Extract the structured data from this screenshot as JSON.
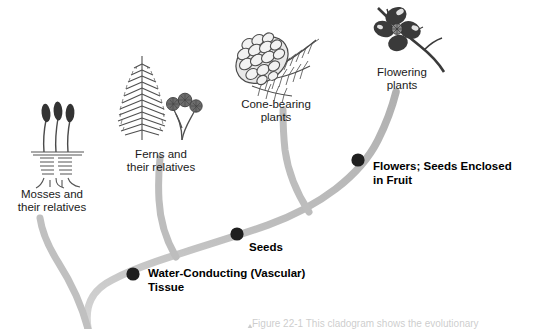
{
  "figure": {
    "background_color": "#ffffff",
    "branch_color": "#b3b3b3",
    "node_color": "#1a1a1a",
    "text_color": "#1a1a1a"
  },
  "taxa": [
    {
      "id": "mosses",
      "label": "Mosses and\ntheir relatives",
      "illustration": "moss-illustration"
    },
    {
      "id": "ferns",
      "label": "Ferns and\ntheir relatives",
      "illustration": "fern-illustration"
    },
    {
      "id": "conifers",
      "label": "Cone-bearing\nplants",
      "illustration": "pine-cone-illustration"
    },
    {
      "id": "angiosperms",
      "label": "Flowering\nplants",
      "illustration": "flower-illustration"
    }
  ],
  "traits": [
    {
      "id": "vascular",
      "label": "Water-Conducting (Vascular)\nTissue"
    },
    {
      "id": "seeds",
      "label": "Seeds"
    },
    {
      "id": "flowers",
      "label": "Flowers; Seeds Enclosed\nin Fruit"
    }
  ],
  "caption": {
    "text": "Figure 22-1  This cladogram shows the evolutionary"
  }
}
